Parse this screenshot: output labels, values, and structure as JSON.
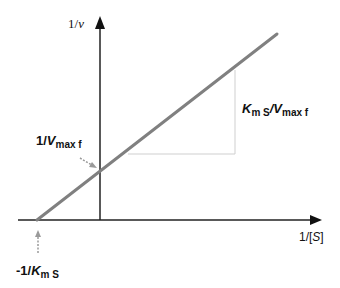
{
  "diagram": {
    "y_axis_label": {
      "prefix": "1/",
      "var": "ν"
    },
    "x_axis_label": {
      "prefix": "1/[",
      "var": "S",
      "suffix": "]"
    },
    "y_intercept_label": {
      "prefix": "1/",
      "var": "V",
      "sub": "max f"
    },
    "x_intercept_label": {
      "prefix": "-1/",
      "var": "K",
      "sub": "m S"
    },
    "slope_label": {
      "var1": "K",
      "sub1": "m S",
      "sep": "/",
      "var2": "V",
      "sub2": "max f"
    },
    "colors": {
      "axis": "#222222",
      "line": "#808080",
      "guide": "#c8c8c8",
      "pointer": "#9a9a9a"
    }
  }
}
